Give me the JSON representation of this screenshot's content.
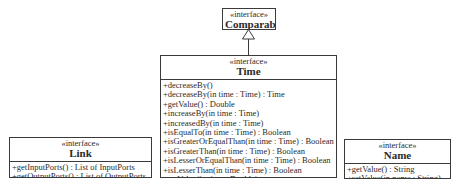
{
  "colors": {
    "background": "#ffffff",
    "border": "#3a3a3a",
    "text": "#2b2b2b"
  },
  "classes": {
    "comparable": {
      "stereotype": "«interface»",
      "name": "Comparable",
      "methods": []
    },
    "time": {
      "stereotype": "«interface»",
      "name": "Time",
      "methods": [
        "+decreaseBy()",
        "+decreaseBy(in time : Time) : Time",
        "+getValue() : Double",
        "+increaseBy(in time : Time)",
        "+increasedBy(in time : Time)",
        "+isEqualTo(in time : Time) : Boolean",
        "+isGreaterOrEqualThan(in time : Time) : Boolean",
        "+isGreaterThan(in time : Time) : Boolean",
        "+isLesserOrEqualThan(in time : Time) : Boolean",
        "+isLesserThan(in time : Time) : Boolean",
        "+setValue(in time : Double)"
      ]
    },
    "link": {
      "stereotype": "«interface»",
      "name": "Link",
      "methods": [
        "+getInputPorts() : List of InputPorts",
        "+getOutputPorts() : List of OutputPorts"
      ]
    },
    "name": {
      "stereotype": "«interface»",
      "name": "Name",
      "methods": [
        "+getValue() : String",
        "+setValue(in name : String)"
      ]
    }
  },
  "relations": [
    {
      "type": "realization",
      "from": "Time",
      "to": "Comparable"
    }
  ]
}
